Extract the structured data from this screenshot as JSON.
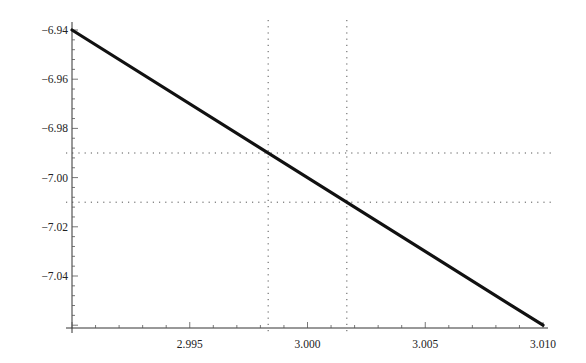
{
  "chart_data": {
    "type": "line",
    "title": "",
    "xlabel": "",
    "ylabel": "",
    "xlim": [
      2.99,
      3.01
    ],
    "ylim": [
      -7.061,
      -6.94
    ],
    "x_ticks": [
      {
        "value": 2.995,
        "label": "2.995"
      },
      {
        "value": 3.0,
        "label": "3.000"
      },
      {
        "value": 3.005,
        "label": "3.005"
      },
      {
        "value": 3.01,
        "label": "3.010"
      }
    ],
    "y_ticks": [
      {
        "value": -6.94,
        "label": "−6.94"
      },
      {
        "value": -6.96,
        "label": "−6.96"
      },
      {
        "value": -6.98,
        "label": "−6.98"
      },
      {
        "value": -7.0,
        "label": "−7.00"
      },
      {
        "value": -7.02,
        "label": "−7.02"
      },
      {
        "value": -7.04,
        "label": "−7.04"
      }
    ],
    "series": [
      {
        "name": "f(x)",
        "x": [
          2.99,
          3.01
        ],
        "y": [
          -6.94,
          -7.06
        ],
        "color": "#111111"
      }
    ],
    "reference_lines": {
      "horizontal": [
        -6.99,
        -7.01
      ],
      "vertical": [
        2.99833,
        3.00167
      ],
      "style": "dotted",
      "color": "#555555"
    },
    "grid": false,
    "legend": null
  }
}
